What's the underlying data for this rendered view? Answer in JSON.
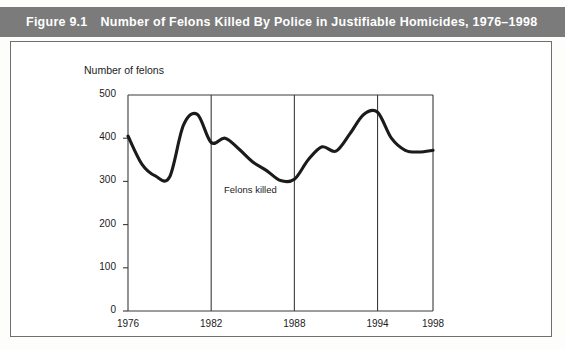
{
  "figure": {
    "number_label": "Figure 9.1",
    "title": "Number of Felons Killed By Police in Justifiable Homicides, 1976–1998",
    "header_color": "#7b7b7b",
    "header_text_color": "#ffffff"
  },
  "chart_data": {
    "type": "line",
    "title": "Number of Felons Killed By Police in Justifiable Homicides, 1976–1998",
    "xlabel": "",
    "ylabel": "Number of felons",
    "axis_title_text": "Number of felons",
    "series_annotation": "Felons killed",
    "grid": "vertical-only",
    "legend_position": "inline-annotation",
    "xlim": [
      1976,
      1998
    ],
    "ylim": [
      0,
      500
    ],
    "ytick_values": [
      0,
      100,
      200,
      300,
      400,
      500
    ],
    "ytick_labels": [
      "0",
      "100",
      "200",
      "300",
      "400",
      "500"
    ],
    "xtick_values": [
      1976,
      1982,
      1988,
      1994,
      1998
    ],
    "xtick_labels": [
      "1976",
      "1982",
      "1988",
      "1994",
      "1998"
    ],
    "gridline_years": [
      1982,
      1988,
      1994
    ],
    "x": [
      1976,
      1977,
      1978,
      1979,
      1980,
      1981,
      1982,
      1983,
      1984,
      1985,
      1986,
      1987,
      1988,
      1989,
      1990,
      1991,
      1992,
      1993,
      1994,
      1995,
      1996,
      1997,
      1998
    ],
    "series": [
      {
        "name": "Felons killed",
        "color": "#1b1b1b",
        "values": [
          405,
          340,
          312,
          310,
          430,
          455,
          390,
          400,
          375,
          345,
          325,
          302,
          305,
          350,
          380,
          370,
          410,
          455,
          460,
          400,
          372,
          368,
          372
        ]
      }
    ]
  }
}
